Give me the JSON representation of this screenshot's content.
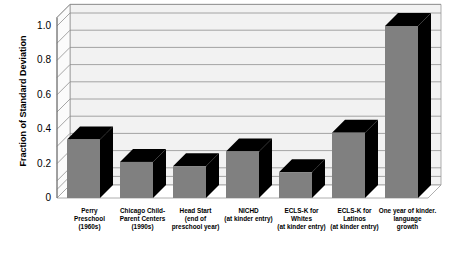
{
  "chart_data": {
    "type": "bar",
    "title": "",
    "xlabel": "",
    "ylabel": "Fraction of Standard Deviation",
    "ylim": [
      0,
      1.05
    ],
    "yticks": [
      0,
      0.2,
      0.4,
      0.6,
      0.8,
      1.0
    ],
    "ytick_labels": [
      "0",
      "0.2",
      "0.4",
      "0.6",
      "0.8",
      "1.0"
    ],
    "gridlines": [
      0.05,
      0.1,
      0.2,
      0.3,
      0.4,
      0.5,
      0.6,
      0.7,
      0.8,
      0.9,
      1.0,
      1.05
    ],
    "grid": true,
    "legend": "none",
    "style": "3d-bar",
    "bar_face_color": "#808080",
    "bar_side_color": "#000000",
    "plot_background": "#f2f2f2",
    "categories": [
      "Perry Preschool (1960s)",
      "Chicago Child-Parent Centers (1990s)",
      "Head Start (end of preschool year)",
      "NICHD (at kinder entry)",
      "ECLS-K for Whites (at kinder entry)",
      "ECLS-K for Latinos (at kinder entry)",
      "One year of kinder. language growth"
    ],
    "category_lines": [
      [
        "Perry",
        "Preschool",
        "(1960s)"
      ],
      [
        "Chicago Child-",
        "Parent Centers",
        "(1990s)"
      ],
      [
        "Head Start",
        "(end of",
        "preschool year)"
      ],
      [
        "NICHD",
        "(at kinder entry)"
      ],
      [
        "ECLS-K for",
        "Whites",
        "(at kinder entry)"
      ],
      [
        "ECLS-K for",
        "Latinos",
        "(at kinder entry)"
      ],
      [
        "One year of kinder.",
        "language",
        "growth"
      ]
    ],
    "values": [
      0.34,
      0.21,
      0.185,
      0.27,
      0.15,
      0.38,
      1.0
    ]
  }
}
